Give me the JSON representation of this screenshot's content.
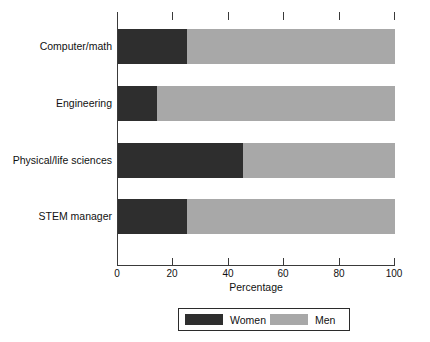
{
  "chart_data": {
    "type": "bar",
    "orientation": "horizontal",
    "stacked": true,
    "title": "",
    "xlabel": "Percentage",
    "ylabel": "",
    "xlim": [
      0,
      100
    ],
    "xticks": [
      0,
      20,
      40,
      60,
      80,
      100
    ],
    "xtick_labels": [
      "0",
      "20",
      "40",
      "60",
      "80",
      "100"
    ],
    "grid": false,
    "legend_position": "bottom",
    "categories": [
      "Computer/math",
      "Engineering",
      "Physical/life sciences",
      "STEM manager"
    ],
    "series": [
      {
        "name": "Women",
        "color": "#2e2e2e",
        "values": [
          25,
          14,
          45,
          25
        ]
      },
      {
        "name": "Men",
        "color": "#a8a8a8",
        "values": [
          75,
          86,
          55,
          75
        ]
      }
    ]
  },
  "axis": {
    "x_title": "Percentage",
    "tick_labels": [
      "0",
      "20",
      "40",
      "60",
      "80",
      "100"
    ]
  },
  "categories": [
    {
      "label": "Computer/math"
    },
    {
      "label": "Engineering"
    },
    {
      "label": "Physical/life sciences"
    },
    {
      "label": "STEM manager"
    }
  ],
  "legend": {
    "entries": [
      {
        "label": "Women",
        "color": "#2e2e2e"
      },
      {
        "label": "Men",
        "color": "#a8a8a8"
      }
    ]
  }
}
